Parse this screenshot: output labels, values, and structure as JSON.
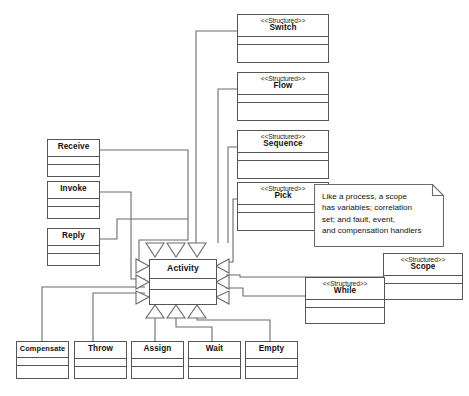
{
  "diagram": {
    "stereotype_text": "<<Structured>>",
    "line_color": "#555555",
    "box_fill": "#ffffff",
    "text_color": "#111111",
    "base_class": {
      "name": "Activity"
    },
    "structured_classes": [
      {
        "name": "Switch",
        "stereotype": "<<Structured>>"
      },
      {
        "name": "Flow",
        "stereotype": "<<Structured>>"
      },
      {
        "name": "Sequence",
        "stereotype": "<<Structured>>"
      },
      {
        "name": "Pick",
        "stereotype": "<<Structured>>"
      },
      {
        "name": "Scope",
        "stereotype": "<<Structured>>"
      },
      {
        "name": "While",
        "stereotype": "<<Structured>>"
      }
    ],
    "basic_classes": [
      {
        "name": "Receive"
      },
      {
        "name": "Invoke"
      },
      {
        "name": "Reply"
      },
      {
        "name": "Compensate"
      },
      {
        "name": "Throw"
      },
      {
        "name": "Assign"
      },
      {
        "name": "Wait"
      },
      {
        "name": "Empty"
      }
    ],
    "note": {
      "text": "Like a process, a scope has variables; correlation set; and fault, event, and compensation handlers",
      "line1": "Like a process, a scope",
      "line2": "has variables; correlation",
      "line3": "set; and fault, event,",
      "line4": "and compensation handlers",
      "attached_to": "Scope"
    }
  }
}
